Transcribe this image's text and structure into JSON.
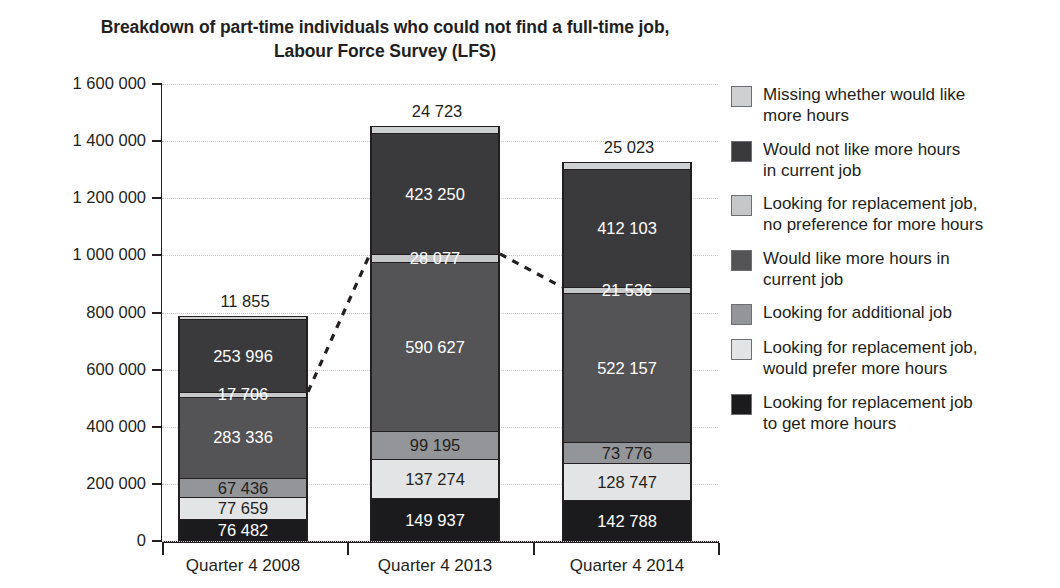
{
  "chart_data": {
    "type": "bar",
    "subtype": "stacked-bar",
    "title": "Breakdown of part-time individuals who could not find a full-time job, Labour Force Survey (LFS)",
    "title_line1": "Breakdown of part-time individuals who could not find a full-time job,",
    "title_line2": "Labour Force Survey (LFS)",
    "xlabel": "",
    "ylabel": "",
    "ylim": [
      0,
      1600000
    ],
    "grid": true,
    "legend_position": "right",
    "categories": [
      "Quarter 4 2008",
      "Quarter 4 2013",
      "Quarter 4 2014"
    ],
    "y_ticks": [
      0,
      200000,
      400000,
      600000,
      800000,
      1000000,
      1200000,
      1400000,
      1600000
    ],
    "y_tick_labels": [
      "0",
      "200 000",
      "400 000",
      "600 000",
      "800 000",
      "1 000 000",
      "1 200 000",
      "1 400 000",
      "1 600 000"
    ],
    "series": [
      {
        "name": "Missing whether would like more hours",
        "color": "#cfd0d2",
        "label_color": "dark",
        "values": [
          11855,
          24723,
          25023
        ],
        "value_labels": [
          "11 855",
          "24 723",
          "25 023"
        ],
        "labels_outside": true
      },
      {
        "name": "Would not like more hours in current job",
        "color": "#3a3a3c",
        "label_color": "light",
        "values": [
          253996,
          423250,
          412103
        ],
        "value_labels": [
          "253 996",
          "423 250",
          "412 103"
        ],
        "labels_outside": false
      },
      {
        "name": "Looking for replacement job, no preference for more hours",
        "color": "#c6c7c9",
        "label_color": "light",
        "values": [
          17706,
          28077,
          21536
        ],
        "value_labels": [
          "17 706",
          "28 077",
          "21 536"
        ],
        "labels_outside": false
      },
      {
        "name": "Would like more hours in current job",
        "color": "#545456",
        "label_color": "light",
        "values": [
          283336,
          590627,
          522157
        ],
        "value_labels": [
          "283 336",
          "590 627",
          "522 157"
        ],
        "labels_outside": false
      },
      {
        "name": "Looking for additional job",
        "color": "#939598",
        "label_color": "dark",
        "values": [
          67436,
          99195,
          73776
        ],
        "value_labels": [
          "67 436",
          "99 195",
          "73 776"
        ],
        "labels_outside": false
      },
      {
        "name": "Looking for replacement job, would prefer more hours",
        "color": "#e3e4e5",
        "label_color": "dark",
        "values": [
          77659,
          137274,
          128747
        ],
        "value_labels": [
          "77 659",
          "137 274",
          "128 747"
        ],
        "labels_outside": false
      },
      {
        "name": "Looking for replacement job to get more hours",
        "color": "#1b1b1d",
        "label_color": "light",
        "values": [
          76482,
          149937,
          142788
        ],
        "value_labels": [
          "76 482",
          "149 937",
          "142 788"
        ],
        "labels_outside": false
      }
    ],
    "totals": [
      788470,
      1453083,
      1326130
    ],
    "annotations": [
      {
        "type": "dashed-connector",
        "from_bar": 0,
        "to_bar": 1
      },
      {
        "type": "dashed-connector",
        "from_bar": 1,
        "to_bar": 2
      }
    ]
  },
  "legend": {
    "items": [
      {
        "label_line1": "Missing whether would like",
        "label_line2": "more hours",
        "color": "#cfd0d2"
      },
      {
        "label_line1": "Would not like more hours",
        "label_line2": "in current job",
        "color": "#3a3a3c"
      },
      {
        "label_line1": "Looking for replacement job,",
        "label_line2": "no preference for more hours",
        "color": "#c6c7c9"
      },
      {
        "label_line1": "Would like more hours in",
        "label_line2": "current job",
        "color": "#545456"
      },
      {
        "label_line1": "Looking for additional job",
        "label_line2": "",
        "color": "#939598"
      },
      {
        "label_line1": "Looking for replacement job,",
        "label_line2": "would prefer more hours",
        "color": "#e3e4e5"
      },
      {
        "label_line1": "Looking for replacement job",
        "label_line2": "to get more hours",
        "color": "#1b1b1d"
      }
    ]
  }
}
